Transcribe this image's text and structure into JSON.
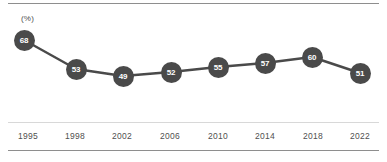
{
  "chart_data": {
    "type": "line",
    "title": "",
    "subtitle": "",
    "xlabel": "",
    "ylabel": "(%)",
    "unit_label": "(%)",
    "categories": [
      "1995",
      "1998",
      "2002",
      "2006",
      "2010",
      "2014",
      "2018",
      "2022"
    ],
    "values": [
      68,
      53,
      49,
      52,
      55,
      57,
      60,
      51
    ],
    "point_labels": [
      "68",
      "53",
      "49",
      "52",
      "55",
      "57",
      "60",
      "51"
    ],
    "series": [
      {
        "name": "",
        "values": [
          68,
          53,
          49,
          52,
          55,
          57,
          60,
          51
        ]
      }
    ],
    "ylim": [
      45,
      70
    ],
    "grid": false,
    "legend": false,
    "legend_position": "none",
    "colors": {
      "line": "#4a4a4a",
      "marker_fill": "#4a4a4a",
      "marker_label": "#ffffff",
      "axis_rule": "#8e8e8e",
      "separator_rule": "#d8d8d8",
      "tick_label": "#4f4f4f",
      "background": "#ffffff"
    },
    "points": [
      {
        "x": 24,
        "y": 40,
        "label": "68",
        "category": "1995"
      },
      {
        "x": 76,
        "y": 69,
        "label": "53",
        "category": "1998"
      },
      {
        "x": 123,
        "y": 76,
        "label": "49",
        "category": "2002"
      },
      {
        "x": 171,
        "y": 72,
        "label": "52",
        "category": "2006"
      },
      {
        "x": 218,
        "y": 67,
        "label": "55",
        "category": "2010"
      },
      {
        "x": 265,
        "y": 63,
        "label": "57",
        "category": "2014"
      },
      {
        "x": 312,
        "y": 57,
        "label": "60",
        "category": "2018"
      },
      {
        "x": 360,
        "y": 73,
        "label": "51",
        "category": "2022"
      }
    ],
    "tick_positions": [
      28,
      75,
      122,
      170,
      218,
      265,
      313,
      360
    ]
  }
}
